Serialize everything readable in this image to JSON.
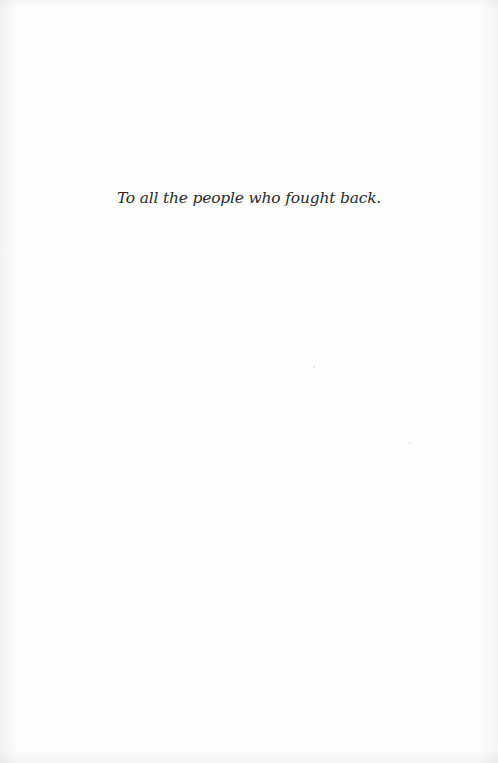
{
  "page": {
    "dedication": "To all the people who fought back.",
    "colors": {
      "background": "#fefefe",
      "text": "#2a2a2a"
    }
  }
}
